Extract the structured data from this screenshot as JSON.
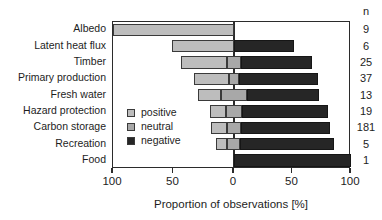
{
  "chart_data": {
    "type": "bar",
    "orientation": "horizontal",
    "style": "diverging-stacked",
    "title": "",
    "xlabel": "Proportion of observations [%]",
    "ylabel": "",
    "xlim": [
      -100,
      100
    ],
    "xticks": [
      -100,
      -50,
      0,
      50,
      100
    ],
    "xtick_labels": [
      "100",
      "50",
      "0",
      "50",
      "100"
    ],
    "grid": false,
    "legend_position": "inside-left-lower",
    "categories": [
      "Albedo",
      "Latent heat flux",
      "Timber",
      "Primary production",
      "Fresh water",
      "Hazard protection",
      "Carbon storage",
      "Recreation",
      "Food"
    ],
    "series": [
      {
        "name": "positive",
        "color": "#bdbdbd",
        "values": [
          100,
          51,
          38,
          29,
          19,
          13,
          13,
          9,
          0
        ]
      },
      {
        "name": "neutral",
        "color": "#a8a8a8",
        "values": [
          0,
          0,
          12,
          8,
          22,
          14,
          12,
          11,
          0
        ]
      },
      {
        "name": "negative",
        "color": "#262626",
        "values": [
          0,
          51,
          61,
          68,
          62,
          73,
          76,
          80,
          100
        ]
      }
    ],
    "annotations": {
      "n_header": "n",
      "n_values": [
        "9",
        "6",
        "25",
        "37",
        "13",
        "19",
        "181",
        "5",
        "1"
      ]
    }
  },
  "legend": {
    "items": [
      {
        "label": "positive",
        "color": "#bdbdbd"
      },
      {
        "label": "neutral",
        "color": "#a8a8a8"
      },
      {
        "label": "negative",
        "color": "#262626"
      }
    ]
  }
}
